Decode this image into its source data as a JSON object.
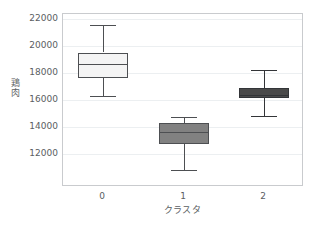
{
  "chart_data": {
    "type": "box",
    "title": "",
    "xlabel": "クラスタ",
    "ylabel": "鶏肉",
    "xlim": [
      -0.5,
      2.5
    ],
    "ylim": [
      9550,
      22350
    ],
    "grid": true,
    "legend": null,
    "categories": [
      "0",
      "1",
      "2"
    ],
    "yticks": [
      22000,
      20000,
      18000,
      16000,
      14000,
      12000
    ],
    "ytick_labels": [
      "22000",
      "20000",
      "18000",
      "16000",
      "14000",
      "12000"
    ],
    "boxes": [
      {
        "category": "0",
        "whisker_low": 16300,
        "q1": 17650,
        "median": 18650,
        "q3": 19500,
        "whisker_high": 21500,
        "fill": "#f4f4f4",
        "edge": "#4d4f52"
      },
      {
        "category": "1",
        "whisker_low": 10800,
        "q1": 12750,
        "median": 13600,
        "q3": 14300,
        "whisker_high": 14750,
        "fill": "#818181",
        "edge": "#4d4f52"
      },
      {
        "category": "2",
        "whisker_low": 14800,
        "q1": 16150,
        "median": 16350,
        "q3": 16900,
        "whisker_high": 18200,
        "fill": "#4a4a4a",
        "edge": "#333538"
      }
    ]
  },
  "style": {
    "axis_color": "#c9cbce",
    "grid_color": "#eceff1",
    "text_color": "#5a5e62",
    "background": "#ffffff"
  }
}
